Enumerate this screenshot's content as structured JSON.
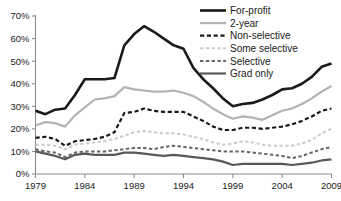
{
  "chart_data": {
    "type": "line",
    "title": "",
    "xlabel": "",
    "ylabel": "",
    "xlim": [
      1979,
      2009
    ],
    "ylim": [
      0,
      70
    ],
    "grid": false,
    "legend_position": "top-right",
    "y_tick_labels": [
      "70%",
      "60%",
      "50%",
      "40%",
      "30%",
      "20%",
      "10%",
      "0%"
    ],
    "y_tick_values": [
      70,
      60,
      50,
      40,
      30,
      20,
      10,
      0
    ],
    "x_tick_labels": [
      "1979",
      "1984",
      "1989",
      "1994",
      "1999",
      "2004",
      "2009"
    ],
    "x_tick_values": [
      1979,
      1984,
      1989,
      1994,
      1999,
      2004,
      2009
    ],
    "x": [
      1979,
      1980,
      1981,
      1982,
      1983,
      1984,
      1985,
      1986,
      1987,
      1988,
      1989,
      1990,
      1991,
      1992,
      1993,
      1994,
      1995,
      1996,
      1997,
      1998,
      1999,
      2000,
      2001,
      2002,
      2003,
      2004,
      2005,
      2006,
      2007,
      2008,
      2009
    ],
    "series": [
      {
        "name": "For-profit",
        "color": "#1a1a1a",
        "style": "solid",
        "width": 2.6,
        "values": [
          28.0,
          26.5,
          28.5,
          29.0,
          35.0,
          42.0,
          42.0,
          42.0,
          42.5,
          57.0,
          62.0,
          65.5,
          63.0,
          60.0,
          57.0,
          55.5,
          47.0,
          42.0,
          38.0,
          33.5,
          30.0,
          31.0,
          31.5,
          33.0,
          35.0,
          37.5,
          38.0,
          40.0,
          43.0,
          47.5,
          49.0
        ]
      },
      {
        "name": "2-year",
        "color": "#b3b3b3",
        "style": "solid",
        "width": 2.2,
        "values": [
          21.5,
          23.0,
          22.5,
          21.0,
          26.0,
          29.5,
          33.0,
          33.5,
          34.5,
          38.5,
          37.5,
          37.0,
          36.5,
          36.5,
          37.0,
          36.0,
          34.5,
          32.0,
          29.0,
          26.5,
          24.5,
          25.5,
          25.0,
          24.0,
          26.0,
          28.0,
          29.0,
          31.0,
          33.5,
          36.5,
          39.0
        ]
      },
      {
        "name": "Non-selective",
        "color": "#1a1a1a",
        "style": "dashed",
        "width": 2.2,
        "values": [
          16.0,
          16.5,
          15.5,
          12.5,
          14.5,
          15.0,
          15.5,
          16.5,
          18.5,
          27.0,
          27.5,
          29.0,
          28.0,
          27.5,
          27.5,
          27.5,
          25.5,
          23.5,
          21.0,
          19.5,
          19.5,
          20.5,
          20.5,
          20.0,
          20.5,
          21.0,
          22.0,
          23.5,
          25.5,
          28.0,
          29.0
        ]
      },
      {
        "name": "Some selective",
        "color": "#cccccc",
        "style": "dashed",
        "width": 2.0,
        "values": [
          13.0,
          13.0,
          12.5,
          11.0,
          13.0,
          13.5,
          14.0,
          14.5,
          15.5,
          17.0,
          18.5,
          19.0,
          18.5,
          18.0,
          18.0,
          17.5,
          16.5,
          15.5,
          14.0,
          13.0,
          13.5,
          14.5,
          14.0,
          13.0,
          12.5,
          12.5,
          12.5,
          13.5,
          15.0,
          18.0,
          20.0
        ]
      },
      {
        "name": "Selective",
        "color": "#676767",
        "style": "dashed",
        "width": 2.0,
        "values": [
          11.0,
          10.0,
          9.5,
          7.5,
          9.5,
          10.0,
          10.0,
          10.0,
          10.5,
          11.0,
          11.5,
          11.5,
          11.0,
          12.0,
          12.5,
          12.0,
          11.5,
          11.0,
          10.5,
          10.0,
          10.0,
          10.0,
          9.5,
          9.0,
          8.5,
          8.0,
          7.0,
          8.0,
          9.5,
          11.0,
          12.0
        ]
      },
      {
        "name": "Grad only",
        "color": "#595959",
        "style": "solid",
        "width": 2.2,
        "values": [
          10.0,
          9.0,
          8.0,
          6.5,
          8.5,
          9.0,
          8.5,
          8.5,
          8.5,
          9.5,
          9.5,
          9.0,
          8.5,
          8.0,
          8.5,
          8.0,
          7.5,
          7.0,
          6.5,
          5.5,
          4.0,
          4.5,
          4.5,
          4.5,
          4.5,
          4.5,
          4.0,
          4.5,
          5.0,
          6.0,
          6.5
        ]
      }
    ]
  },
  "legend": {
    "items": [
      {
        "label": "For-profit"
      },
      {
        "label": "2-year"
      },
      {
        "label": "Non-selective"
      },
      {
        "label": "Some selective"
      },
      {
        "label": "Selective"
      },
      {
        "label": "Grad only"
      }
    ]
  },
  "colors": {
    "for_profit": "#1a1a1a",
    "two_year": "#b3b3b3",
    "non_selective": "#1a1a1a",
    "some_selective": "#cccccc",
    "selective": "#676767",
    "grad_only": "#595959",
    "axis": "#8c8c8c",
    "background": "#ffffff"
  }
}
